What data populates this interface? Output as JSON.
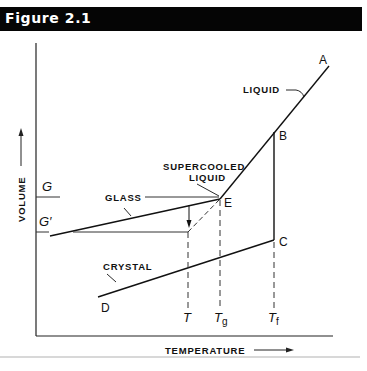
{
  "header": {
    "title": "Figure 2.1"
  },
  "axes": {
    "x_label": "TEMPERATURE",
    "y_label": "VOLUME"
  },
  "curve_labels": {
    "liquid": "LIQUID",
    "supercooled_line1": "SUPERCOOLED",
    "supercooled_line2": "LIQUID",
    "glass": "GLASS",
    "crystal": "CRYSTAL"
  },
  "points": {
    "A": "A",
    "B": "B",
    "C": "C",
    "D": "D",
    "E": "E"
  },
  "y_ticks": {
    "G": "G",
    "G_prime": "G′"
  },
  "x_ticks": {
    "T": "T",
    "Tg_main": "T",
    "Tg_sub": "g",
    "Tf_main": "T",
    "Tf_sub": "f"
  },
  "colors": {
    "header_bg": "#050505",
    "header_text": "#ffffff",
    "ink": "#111111",
    "rule": "#d8d8d8"
  }
}
